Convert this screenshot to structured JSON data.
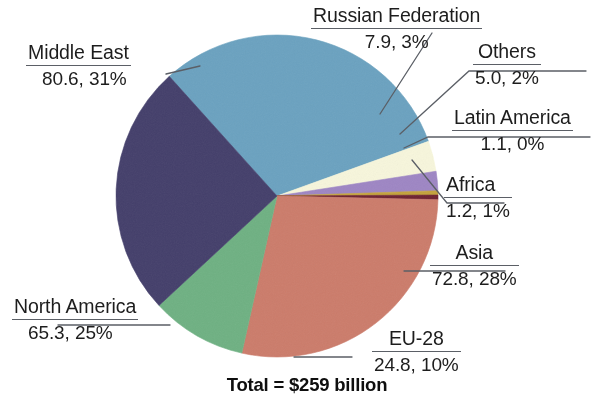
{
  "chart_data": {
    "type": "pie",
    "title": "",
    "total_label": "Total = $259 billion",
    "total_value": 259,
    "unit": "$ billion",
    "legend": "none",
    "labels_show": "name, value, percent",
    "categories": [
      "Middle East",
      "Russian Federation",
      "Others",
      "Latin America",
      "Africa",
      "Asia",
      "EU-28",
      "North America"
    ],
    "values": [
      80.6,
      7.9,
      5.0,
      1.1,
      1.2,
      72.8,
      24.8,
      65.3
    ],
    "percents": [
      31,
      3,
      2,
      0,
      1,
      28,
      10,
      25
    ],
    "colors": [
      "#6BA2C0",
      "#F7F6DC",
      "#9E86C4",
      "#C4A33C",
      "#6E2230",
      "#CC7C6B",
      "#6FB183",
      "#443F6B"
    ],
    "slices": [
      {
        "name": "Middle East",
        "value": 80.6,
        "percent": 31,
        "value_text": "80.6, 31%",
        "color": "#6BA2C0"
      },
      {
        "name": "Russian Federation",
        "value": 7.9,
        "percent": 3,
        "value_text": "7.9, 3%",
        "color": "#F7F6DC"
      },
      {
        "name": "Others",
        "value": 5.0,
        "percent": 2,
        "value_text": "5.0, 2%",
        "color": "#9E86C4"
      },
      {
        "name": "Latin America",
        "value": 1.1,
        "percent": 0,
        "value_text": "1.1, 0%",
        "color": "#C4A33C"
      },
      {
        "name": "Africa",
        "value": 1.2,
        "percent": 1,
        "value_text": "1.2, 1%",
        "color": "#6E2230"
      },
      {
        "name": "Asia",
        "value": 72.8,
        "percent": 28,
        "value_text": "72.8, 28%",
        "color": "#CC7C6B"
      },
      {
        "name": "EU-28",
        "value": 24.8,
        "percent": 10,
        "value_text": "24.8, 10%",
        "color": "#6FB183"
      },
      {
        "name": "North America",
        "value": 65.3,
        "percent": 25,
        "value_text": "65.3, 25%",
        "color": "#443F6B"
      }
    ]
  },
  "labels": {
    "middle_east": {
      "name": "Middle East",
      "value": "80.6, 31%"
    },
    "russian_federation": {
      "name": "Russian Federation",
      "value": "7.9, 3%"
    },
    "others": {
      "name": "Others",
      "value": "5.0, 2%"
    },
    "latin_america": {
      "name": "Latin America",
      "value": "1.1, 0%"
    },
    "africa": {
      "name": "Africa",
      "value": "1.2, 1%"
    },
    "asia": {
      "name": "Asia",
      "value": "72.8, 28%"
    },
    "eu28": {
      "name": "EU-28",
      "value": "24.8, 10%"
    },
    "north_america": {
      "name": "North America",
      "value": "65.3, 25%"
    }
  },
  "footer": {
    "total": "Total = $259 billion"
  }
}
